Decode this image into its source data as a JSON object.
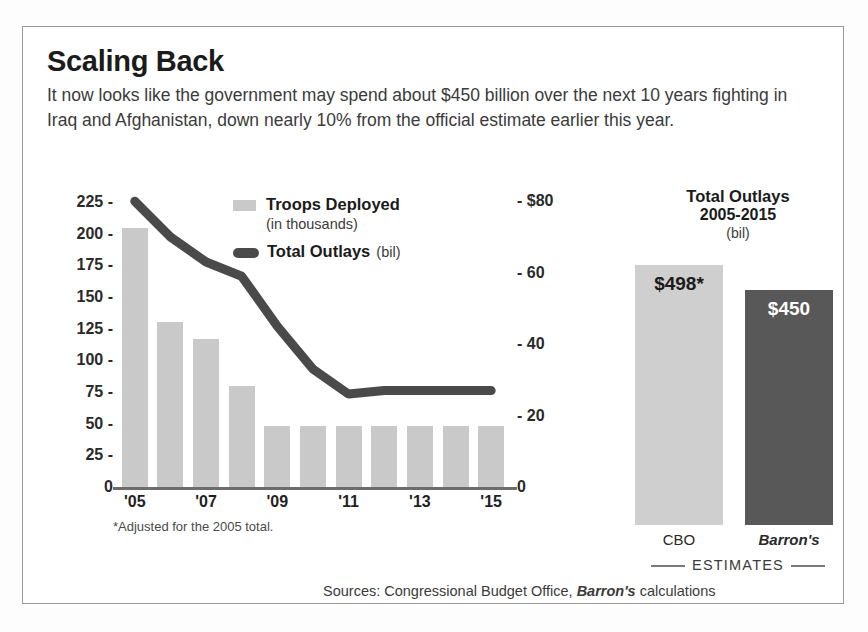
{
  "headline": "Scaling Back",
  "deck": "It now looks like the government may spend about $450 billion over the next 10 years fighting in Iraq and Afghanistan, down nearly 10% from the official estimate earlier this year.",
  "legend": {
    "troops_label": "Troops Deployed",
    "troops_sub": "(in thousands)",
    "outlays_label": "Total Outlays",
    "outlays_sub": "(bil)",
    "troops_color": "#c9c9c9",
    "outlays_color": "#4a4a4a"
  },
  "footnote": "*Adjusted for the 2005 total.",
  "sources": {
    "prefix": "Sources: Congressional Budget Office, ",
    "italic": "Barron's",
    "suffix": " calculations"
  },
  "side_panel": {
    "title": "Total Outlays",
    "years": "2005-2015",
    "unit": "(bil)",
    "estimates_label": "ESTIMATES",
    "bars": [
      {
        "name": "CBO",
        "value_label": "$498*",
        "value": 498,
        "color": "#cfcfcf"
      },
      {
        "name": "Barron's",
        "value_label": "$450",
        "value": 450,
        "color": "#585858"
      }
    ]
  },
  "chart_data": {
    "type": "bar",
    "title": "Scaling Back",
    "xlabel": "",
    "ylabel": "Troops Deployed (in thousands)",
    "y2label": "Total Outlays (bil)",
    "grid": false,
    "legend_position": "top-center",
    "categories": [
      "2005",
      "2006",
      "2007",
      "2008",
      "2009",
      "2010",
      "2011",
      "2012",
      "2013",
      "2014",
      "2015"
    ],
    "tick_labels": [
      "'05",
      "",
      "'07",
      "",
      "'09",
      "",
      "'11",
      "",
      "'13",
      "",
      "'15"
    ],
    "ylim": [
      0,
      237
    ],
    "yticks": [
      0,
      25,
      50,
      75,
      100,
      125,
      150,
      175,
      200,
      225
    ],
    "ytick_labels": [
      "0",
      "25",
      "50",
      "75",
      "100",
      "125",
      "150",
      "175",
      "200",
      "225"
    ],
    "y2lim": [
      0,
      84
    ],
    "y2ticks": [
      0,
      20,
      40,
      60,
      80
    ],
    "y2tick_labels": [
      "0",
      "20",
      "40",
      "60",
      "$80"
    ],
    "series": [
      {
        "name": "Troops Deployed (in thousands)",
        "type": "bar",
        "axis": "left",
        "color": "#c9c9c9",
        "values": [
          205,
          130,
          117,
          80,
          48,
          48,
          48,
          48,
          48,
          48,
          48
        ]
      },
      {
        "name": "Total Outlays (bil)",
        "type": "line",
        "axis": "right",
        "color": "#4a4a4a",
        "values": [
          80,
          70,
          63,
          59,
          45,
          33,
          26,
          27,
          27,
          27,
          27
        ]
      }
    ],
    "side_chart": {
      "type": "bar",
      "title": "Total Outlays 2005-2015 (bil)",
      "categories": [
        "CBO",
        "Barron's"
      ],
      "values": [
        498,
        450
      ],
      "data_labels": [
        "$498*",
        "$450"
      ],
      "footer": "ESTIMATES"
    }
  }
}
